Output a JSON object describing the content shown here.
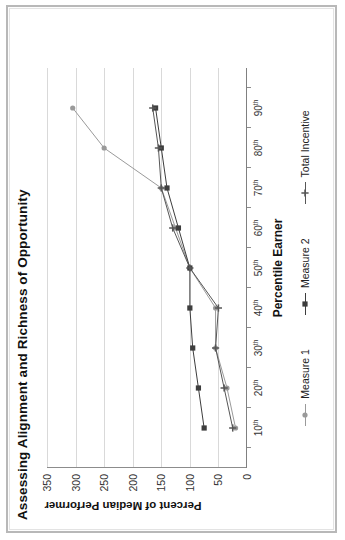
{
  "figure": {
    "title": "Assessing Alignment and Richness of Opportunity",
    "frame_color": "#b8b8b8",
    "background": "#ffffff"
  },
  "chart_data": {
    "type": "line",
    "title": "Assessing Alignment and Richness of Opportunity",
    "xlabel": "Percentile Earner",
    "ylabel": "Percent of Median Performer",
    "categories": [
      "10th",
      "20th",
      "30th",
      "40th",
      "50th",
      "60th",
      "70th",
      "80th",
      "90th"
    ],
    "x": [
      10,
      20,
      30,
      40,
      50,
      60,
      70,
      80,
      90
    ],
    "ylim": [
      0,
      350
    ],
    "yticks": [
      0,
      50,
      100,
      150,
      200,
      250,
      300,
      350
    ],
    "ytick_labels": [
      "0",
      "50",
      "100",
      "150",
      "200",
      "250",
      "300",
      "350"
    ],
    "xtick_labels": [
      "10th",
      "20th",
      "30th",
      "40th",
      "50th",
      "60th",
      "70th",
      "80th",
      "90th"
    ],
    "grid": "horizontal",
    "legend_position": "bottom",
    "series": [
      {
        "name": "Measure 1",
        "color": "#9a9a9a",
        "marker": "circle",
        "values": [
          20,
          35,
          55,
          55,
          100,
          125,
          150,
          250,
          305
        ]
      },
      {
        "name": "Measure 2",
        "color": "#3d3d3d",
        "marker": "square",
        "values": [
          75,
          85,
          95,
          100,
          100,
          120,
          140,
          150,
          160
        ]
      },
      {
        "name": "Total Incentive",
        "color": "#565656",
        "marker": "cross",
        "values": [
          25,
          40,
          55,
          50,
          100,
          130,
          150,
          155,
          165
        ]
      }
    ]
  },
  "axes": {
    "x_title": "Percentile Earner",
    "y_title": "Percent of Median Performer",
    "x_labels": [
      {
        "num": "10",
        "sup": "th"
      },
      {
        "num": "20",
        "sup": "th"
      },
      {
        "num": "30",
        "sup": "th"
      },
      {
        "num": "40",
        "sup": "th"
      },
      {
        "num": "50",
        "sup": "th"
      },
      {
        "num": "60",
        "sup": "th"
      },
      {
        "num": "70",
        "sup": "th"
      },
      {
        "num": "80",
        "sup": "th"
      },
      {
        "num": "90",
        "sup": "th"
      }
    ],
    "y_labels": [
      "350",
      "300",
      "250",
      "200",
      "150",
      "100",
      "50",
      "0"
    ]
  },
  "legend": {
    "items": [
      {
        "label": "Measure 1",
        "color": "#9a9a9a",
        "marker": "circle"
      },
      {
        "label": "Measure 2",
        "color": "#3d3d3d",
        "marker": "square"
      },
      {
        "label": "Total Incentive",
        "color": "#565656",
        "marker": "cross"
      }
    ]
  }
}
